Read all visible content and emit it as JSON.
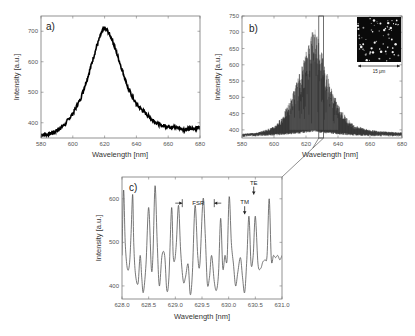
{
  "figure": {
    "width": 415,
    "height": 336
  },
  "chart_data": [
    {
      "id": "a",
      "type": "line",
      "panel_label": "a)",
      "title": "",
      "xlabel": "Wavelength [nm]",
      "ylabel": "Intensity [a.u.]",
      "xlim": [
        580,
        680
      ],
      "ylim": [
        350,
        750
      ],
      "xticks": [
        580,
        600,
        620,
        640,
        660,
        680
      ],
      "yticks": [
        400,
        500,
        600,
        700
      ],
      "grid": false,
      "description": "Broad photoluminescence spectrum, single peak near 620 nm",
      "x": [
        580,
        585,
        590,
        595,
        600,
        605,
        610,
        615,
        618,
        620,
        622,
        625,
        630,
        635,
        640,
        645,
        650,
        655,
        660,
        665,
        670,
        675,
        680
      ],
      "y": [
        360,
        362,
        375,
        395,
        430,
        480,
        560,
        650,
        695,
        710,
        700,
        670,
        590,
        510,
        460,
        435,
        410,
        392,
        388,
        385,
        378,
        380,
        385
      ],
      "noise": 6,
      "color": "#000000"
    },
    {
      "id": "b",
      "type": "line",
      "panel_label": "b)",
      "title": "",
      "xlabel": "Wavelength [nm]",
      "ylabel": "Intensity [a.u.]",
      "xlim": [
        580,
        680
      ],
      "ylim": [
        375,
        750
      ],
      "xticks": [
        580,
        600,
        620,
        640,
        660,
        680
      ],
      "yticks": [
        400,
        450,
        500,
        550,
        600,
        650,
        700,
        750
      ],
      "grid": false,
      "description": "Dense multimode lasing spectrum with many sharp peaks around 610-640 nm, envelope max near 625 nm",
      "envelope_x": [
        580,
        590,
        600,
        605,
        610,
        615,
        620,
        623,
        625,
        628,
        630,
        635,
        640,
        645,
        650,
        660,
        670,
        680
      ],
      "envelope_top": [
        388,
        392,
        410,
        440,
        490,
        560,
        640,
        700,
        720,
        690,
        640,
        540,
        480,
        440,
        415,
        400,
        395,
        392
      ],
      "baseline": [
        382,
        384,
        386,
        388,
        390,
        392,
        395,
        397,
        398,
        396,
        394,
        392,
        390,
        388,
        386,
        384,
        384,
        383
      ],
      "zoom_box": {
        "x_from": 628,
        "x_to": 631
      },
      "inset": {
        "description": "Dark micrograph with bright scattered particles",
        "scale_bar_label": "15 μm"
      },
      "color": "#000000"
    },
    {
      "id": "c",
      "type": "line",
      "panel_label": "c)",
      "title": "",
      "xlabel": "Wavelength [nm]",
      "ylabel": "Intensity [a.u.]",
      "xlim": [
        628.0,
        631.0
      ],
      "ylim": [
        370,
        650
      ],
      "xticks": [
        628.0,
        628.5,
        629.0,
        629.5,
        630.0,
        630.5,
        631.0
      ],
      "xtick_labels": [
        "628.0",
        "628.5",
        "629.0",
        "629.5",
        "630.0",
        "630.5",
        "631.0"
      ],
      "yticks": [
        400,
        500,
        600
      ],
      "grid": false,
      "description": "Zoom of panel b showing periodic whispering-gallery mode peaks",
      "x": [
        628.0,
        628.03,
        628.06,
        628.1,
        628.14,
        628.17,
        628.2,
        628.22,
        628.25,
        628.3,
        628.34,
        628.37,
        628.4,
        628.45,
        628.5,
        628.55,
        628.58,
        628.62,
        628.66,
        628.7,
        628.75,
        628.8,
        628.84,
        628.88,
        628.93,
        628.96,
        628.99,
        629.02,
        629.06,
        629.1,
        629.15,
        629.19,
        629.24,
        629.28,
        629.32,
        629.37,
        629.42,
        629.46,
        629.52,
        629.56,
        629.6,
        629.64,
        629.68,
        629.73,
        629.77,
        629.81,
        629.85,
        629.89,
        629.93,
        629.97,
        630.01,
        630.05,
        630.09,
        630.13,
        630.17,
        630.22,
        630.26,
        630.3,
        630.34,
        630.38,
        630.42,
        630.46,
        630.5,
        630.55,
        630.6,
        630.64,
        630.68,
        630.72,
        630.76,
        630.8,
        630.84,
        630.88,
        630.92,
        630.96,
        631.0
      ],
      "y": [
        470,
        620,
        500,
        440,
        450,
        520,
        610,
        500,
        430,
        405,
        470,
        420,
        385,
        450,
        580,
        440,
        470,
        630,
        500,
        400,
        470,
        470,
        390,
        420,
        580,
        470,
        460,
        500,
        585,
        480,
        410,
        420,
        450,
        380,
        430,
        585,
        470,
        450,
        600,
        520,
        405,
        420,
        470,
        410,
        390,
        430,
        555,
        440,
        470,
        460,
        605,
        500,
        450,
        400,
        430,
        465,
        420,
        385,
        460,
        560,
        450,
        470,
        560,
        450,
        440,
        455,
        460,
        470,
        600,
        460,
        470,
        465,
        470,
        460,
        470
      ],
      "annotations": [
        {
          "text": "FSR",
          "type": "double-arrow-bracket",
          "x_from": 629.13,
          "x_to": 629.73,
          "y": 590
        },
        {
          "text": "TM",
          "type": "down-arrow",
          "x": 630.3,
          "y": 560
        },
        {
          "text": "TE",
          "type": "down-arrow",
          "x": 630.47,
          "y": 605
        }
      ],
      "color": "#555555"
    }
  ]
}
